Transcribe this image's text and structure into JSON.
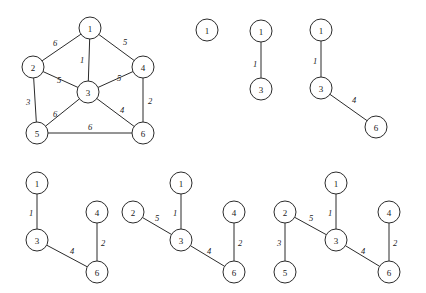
{
  "figure": {
    "background_color": "#ffffff",
    "stroke_color": "#2b2b2b",
    "node_radius": 11,
    "panels": [
      {
        "id": "panel-full-graph",
        "name": "original-weighted-graph",
        "nodes": [
          {
            "id": "n1",
            "label": "1",
            "x": 90,
            "y": 28
          },
          {
            "id": "n2",
            "label": "2",
            "x": 33,
            "y": 67
          },
          {
            "id": "n3",
            "label": "3",
            "x": 88,
            "y": 92
          },
          {
            "id": "n4",
            "label": "4",
            "x": 143,
            "y": 67
          },
          {
            "id": "n5",
            "label": "5",
            "x": 37,
            "y": 133
          },
          {
            "id": "n6",
            "label": "6",
            "x": 143,
            "y": 133
          }
        ],
        "edges": [
          {
            "from": "n1",
            "to": "n2",
            "weight": "6",
            "lx": 55,
            "ly": 43
          },
          {
            "from": "n1",
            "to": "n4",
            "weight": "5",
            "lx": 125,
            "ly": 42
          },
          {
            "from": "n1",
            "to": "n3",
            "weight": "1",
            "lx": 82,
            "ly": 60
          },
          {
            "from": "n2",
            "to": "n3",
            "weight": "5",
            "lx": 59,
            "ly": 80
          },
          {
            "from": "n3",
            "to": "n4",
            "weight": "5",
            "lx": 119,
            "ly": 78
          },
          {
            "from": "n2",
            "to": "n5",
            "weight": "3",
            "lx": 28,
            "ly": 102
          },
          {
            "from": "n3",
            "to": "n5",
            "weight": "6",
            "lx": 55,
            "ly": 114
          },
          {
            "from": "n3",
            "to": "n6",
            "weight": "4",
            "lx": 122,
            "ly": 110
          },
          {
            "from": "n4",
            "to": "n6",
            "weight": "2",
            "lx": 150,
            "ly": 101
          },
          {
            "from": "n5",
            "to": "n6",
            "weight": "6",
            "lx": 90,
            "ly": 127
          }
        ]
      },
      {
        "id": "panel-step-1",
        "name": "mst-step-single-node",
        "nodes": [
          {
            "id": "n1",
            "label": "1",
            "x": 207,
            "y": 30
          }
        ],
        "edges": []
      },
      {
        "id": "panel-step-2",
        "name": "mst-step-one-edge",
        "nodes": [
          {
            "id": "n1",
            "label": "1",
            "x": 261,
            "y": 31
          },
          {
            "id": "n3",
            "label": "3",
            "x": 261,
            "y": 89
          }
        ],
        "edges": [
          {
            "from": "n1",
            "to": "n3",
            "weight": "1",
            "lx": 255,
            "ly": 64
          }
        ]
      },
      {
        "id": "panel-step-3",
        "name": "mst-step-two-edges",
        "nodes": [
          {
            "id": "n1",
            "label": "1",
            "x": 321,
            "y": 30
          },
          {
            "id": "n3",
            "label": "3",
            "x": 321,
            "y": 88
          },
          {
            "id": "n6",
            "label": "6",
            "x": 376,
            "y": 127
          }
        ],
        "edges": [
          {
            "from": "n1",
            "to": "n3",
            "weight": "1",
            "lx": 315,
            "ly": 61
          },
          {
            "from": "n3",
            "to": "n6",
            "weight": "4",
            "lx": 354,
            "ly": 100
          }
        ]
      },
      {
        "id": "panel-step-4",
        "name": "mst-step-three-edges",
        "nodes": [
          {
            "id": "n1",
            "label": "1",
            "x": 37,
            "y": 183
          },
          {
            "id": "n3",
            "label": "3",
            "x": 37,
            "y": 240
          },
          {
            "id": "n4",
            "label": "4",
            "x": 97,
            "y": 212
          },
          {
            "id": "n6",
            "label": "6",
            "x": 97,
            "y": 272
          }
        ],
        "edges": [
          {
            "from": "n1",
            "to": "n3",
            "weight": "1",
            "lx": 31,
            "ly": 213
          },
          {
            "from": "n3",
            "to": "n6",
            "weight": "4",
            "lx": 72,
            "ly": 251
          },
          {
            "from": "n4",
            "to": "n6",
            "weight": "2",
            "lx": 103,
            "ly": 243
          }
        ]
      },
      {
        "id": "panel-step-5",
        "name": "mst-step-four-edges",
        "nodes": [
          {
            "id": "n1",
            "label": "1",
            "x": 181,
            "y": 183
          },
          {
            "id": "n2",
            "label": "2",
            "x": 133,
            "y": 212
          },
          {
            "id": "n3",
            "label": "3",
            "x": 181,
            "y": 240
          },
          {
            "id": "n4",
            "label": "4",
            "x": 234,
            "y": 212
          },
          {
            "id": "n6",
            "label": "6",
            "x": 234,
            "y": 272
          }
        ],
        "edges": [
          {
            "from": "n1",
            "to": "n3",
            "weight": "1",
            "lx": 175,
            "ly": 213
          },
          {
            "from": "n2",
            "to": "n3",
            "weight": "5",
            "lx": 157,
            "ly": 218
          },
          {
            "from": "n3",
            "to": "n6",
            "weight": "4",
            "lx": 209,
            "ly": 251
          },
          {
            "from": "n4",
            "to": "n6",
            "weight": "2",
            "lx": 240,
            "ly": 243
          }
        ]
      },
      {
        "id": "panel-step-6",
        "name": "mst-step-complete",
        "nodes": [
          {
            "id": "n1",
            "label": "1",
            "x": 336,
            "y": 183
          },
          {
            "id": "n2",
            "label": "2",
            "x": 285,
            "y": 212
          },
          {
            "id": "n3",
            "label": "3",
            "x": 336,
            "y": 240
          },
          {
            "id": "n4",
            "label": "4",
            "x": 389,
            "y": 212
          },
          {
            "id": "n5",
            "label": "5",
            "x": 285,
            "y": 272
          },
          {
            "id": "n6",
            "label": "6",
            "x": 389,
            "y": 272
          }
        ],
        "edges": [
          {
            "from": "n1",
            "to": "n3",
            "weight": "1",
            "lx": 330,
            "ly": 213
          },
          {
            "from": "n2",
            "to": "n3",
            "weight": "5",
            "lx": 311,
            "ly": 218
          },
          {
            "from": "n2",
            "to": "n5",
            "weight": "3",
            "lx": 279,
            "ly": 243
          },
          {
            "from": "n3",
            "to": "n6",
            "weight": "4",
            "lx": 363,
            "ly": 251
          },
          {
            "from": "n4",
            "to": "n6",
            "weight": "2",
            "lx": 395,
            "ly": 243
          }
        ]
      }
    ]
  }
}
